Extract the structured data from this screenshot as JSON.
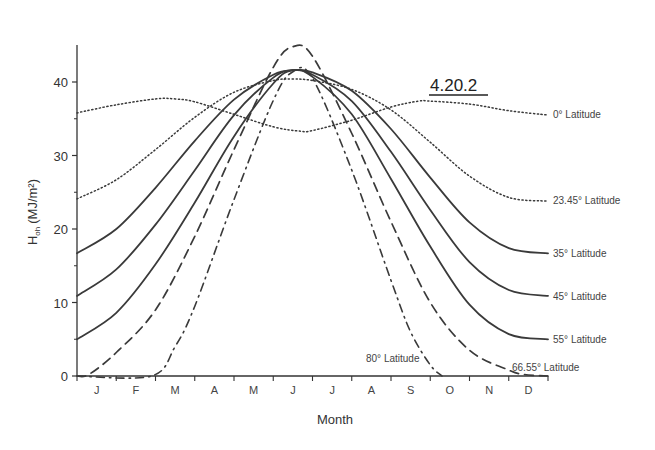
{
  "chart_data": {
    "type": "line",
    "title": "4.20.2",
    "xlabel": "Month",
    "ylabel": "H_oh (MJ/m²)",
    "ylabel_main": "H",
    "ylabel_sub": "oh",
    "ylabel_units": "(MJ/m²)",
    "ylim": [
      0,
      45
    ],
    "yticks": [
      0,
      10,
      20,
      30,
      40
    ],
    "categories": [
      "J",
      "F",
      "M",
      "A",
      "M",
      "J",
      "J",
      "A",
      "S",
      "O",
      "N",
      "D"
    ],
    "x_unit": "month index (0 = Jan 1, 12 = Dec 31)",
    "grid": false,
    "series": [
      {
        "name": "0° Latitude",
        "style": "dotted",
        "x": [
          0,
          1,
          2,
          2.5,
          3,
          4,
          5,
          5.7,
          6,
          7,
          8,
          8.7,
          9,
          10,
          11,
          12
        ],
        "values": [
          35.8,
          36.9,
          37.7,
          37.7,
          37.3,
          35.6,
          33.9,
          33.3,
          33.4,
          34.8,
          36.6,
          37.4,
          37.4,
          37.0,
          36.1,
          35.5
        ]
      },
      {
        "name": "23.45° Latitude",
        "style": "dotted",
        "x": [
          0,
          1,
          2,
          3,
          4,
          5,
          5.5,
          6,
          7,
          8,
          9,
          10,
          11,
          12
        ],
        "values": [
          24.1,
          26.7,
          30.8,
          35.2,
          38.6,
          40.2,
          40.4,
          40.2,
          39.0,
          36.2,
          31.8,
          27.2,
          24.3,
          23.8
        ]
      },
      {
        "name": "35° Latitude",
        "style": "solid",
        "x": [
          0,
          1,
          2,
          3,
          4,
          5,
          5.5,
          6,
          7,
          8,
          9,
          10,
          11,
          12
        ],
        "values": [
          16.7,
          20.0,
          25.6,
          32.0,
          37.6,
          41.0,
          41.6,
          41.3,
          38.8,
          33.6,
          27.0,
          20.9,
          17.4,
          16.7
        ]
      },
      {
        "name": "45° Latitude",
        "style": "solid",
        "x": [
          0,
          1,
          2,
          3,
          4,
          5,
          5.5,
          6,
          7,
          8,
          9,
          10,
          11,
          12
        ],
        "values": [
          10.9,
          14.5,
          20.6,
          28.0,
          35.5,
          40.6,
          41.6,
          41.0,
          37.4,
          30.5,
          22.6,
          15.5,
          11.7,
          10.9
        ]
      },
      {
        "name": "55° Latitude",
        "style": "solid",
        "x": [
          0,
          1,
          2,
          3,
          4,
          5,
          5.5,
          6,
          7,
          8,
          9,
          10,
          11,
          12
        ],
        "values": [
          5.0,
          8.6,
          15.2,
          23.6,
          32.6,
          39.8,
          41.6,
          40.7,
          35.6,
          26.8,
          17.6,
          9.7,
          5.7,
          5.0
        ]
      },
      {
        "name": "66.55° Latitude",
        "style": "dashed",
        "x": [
          0,
          0.3,
          1,
          2,
          3,
          4,
          5,
          5.5,
          6,
          7,
          8,
          9,
          10,
          11,
          11.4,
          12
        ],
        "values": [
          0,
          0.2,
          3.2,
          9.0,
          19.0,
          30.8,
          42.0,
          44.8,
          43.5,
          33.0,
          21.0,
          10.0,
          3.5,
          0.8,
          0.2,
          0
        ],
        "label_position": "right, just above axis"
      },
      {
        "name": "80° Latitude",
        "style": "dash-dot",
        "x": [
          0,
          1.9,
          2.5,
          3,
          4,
          5,
          5.5,
          6,
          7,
          8,
          8.5,
          9,
          9.3
        ],
        "values": [
          0,
          0,
          4.0,
          9.5,
          24.0,
          37.5,
          41.4,
          40.5,
          28.0,
          13.0,
          6.0,
          1.5,
          0
        ],
        "label_position": "near O, just above axis"
      }
    ]
  }
}
